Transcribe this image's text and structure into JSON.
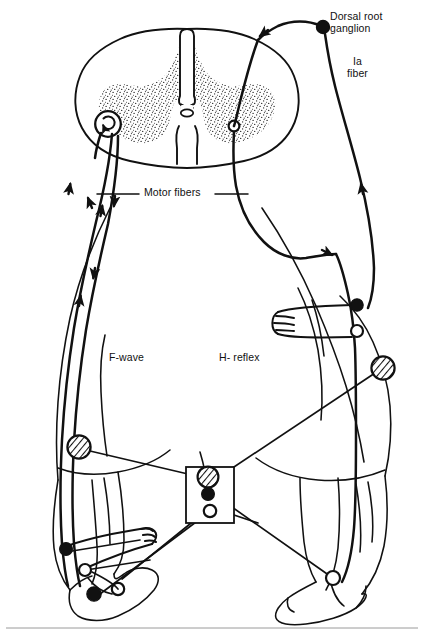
{
  "labels": {
    "dorsal_root_ganglion": "Dorsal root\nganglion",
    "ia_fiber": "Ia\nfiber",
    "motor_fibers": "Motor fibers",
    "f_wave": "F-wave",
    "h_reflex": "H- reflex"
  },
  "colors": {
    "ink": "#111111",
    "paper": "#ffffff",
    "stipple": "#333333"
  },
  "markers": {
    "filled_circle": "filled-black-circle",
    "open_circle": "open-white-circle",
    "hatched_circle": "hatched-electrode-circle"
  },
  "anatomy": {
    "spinal_cord": "transverse section with butterfly gray matter, central canal, dorsal and ventral median fissures",
    "body": "posterior view outline of human trunk, legs and feet",
    "muscle_spindles": "fork-shaped spindle symbols in right calf and both feet"
  },
  "electrodes": {
    "left_thigh": "hatched-electrode-circle",
    "right_thigh": "hatched-electrode-circle",
    "stimulator_box": "hatched-electrode-circle",
    "stimulator_box_active": "filled-black-circle",
    "stimulator_box_reference": "open-white-circle"
  },
  "arrows": {
    "antidromic": "down-arrow along motor fiber",
    "orthodromic": "up-arrow along motor fiber",
    "afferent": "up-arrow along Ia fiber",
    "efferent": "down-arrow along motor fiber to muscle"
  },
  "neurons": {
    "anterior_horn_cell": "circle with recurrent spiral arrow (F-wave backfiring motoneuron)",
    "synapse": "open circle on right ventral horn (H-reflex monosynaptic connection)"
  }
}
